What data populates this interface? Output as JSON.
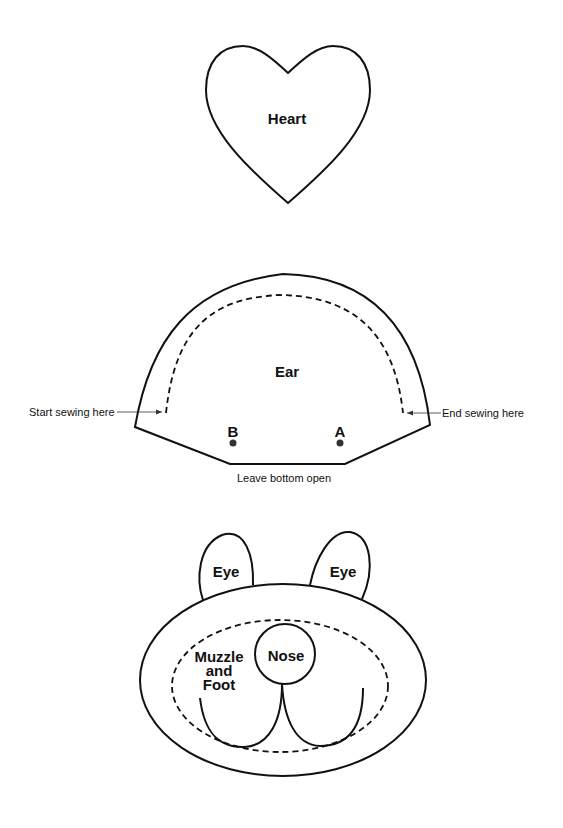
{
  "pattern_pieces": {
    "heart": {
      "label": "Heart"
    },
    "ear": {
      "label": "Ear",
      "start_note": "Start sewing here",
      "end_note": "End sewing here",
      "bottom_note": "Leave bottom open",
      "point_b": "B",
      "point_a": "A"
    },
    "eye_left": {
      "label": "Eye"
    },
    "eye_right": {
      "label": "Eye"
    },
    "nose": {
      "label": "Nose"
    },
    "muzzle": {
      "label_line1": "Muzzle",
      "label_line2": "and",
      "label_line3": "Foot"
    }
  },
  "colors": {
    "stroke": "#111111",
    "background": "#ffffff",
    "dot": "#333333"
  }
}
